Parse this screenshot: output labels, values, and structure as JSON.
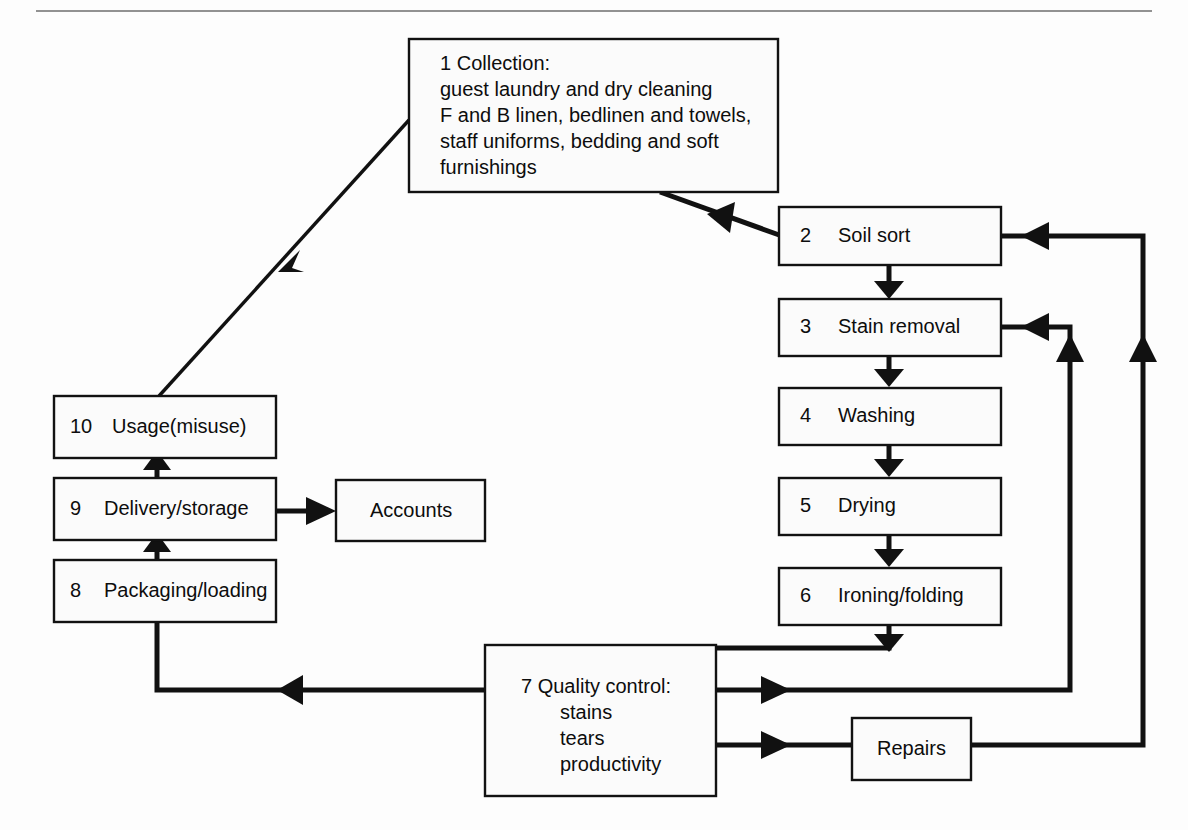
{
  "figure": {
    "top_rule": true,
    "ink_color": "#111111",
    "box_fill": "#fbfbfb"
  },
  "nodes": {
    "collection": {
      "number": "1",
      "title": "Collection:",
      "lines": [
        "guest laundry and dry cleaning",
        "F and B linen, bedlinen and towels,",
        "staff uniforms, bedding and soft",
        "furnishings"
      ]
    },
    "soil_sort": {
      "number": "2",
      "label": "Soil sort"
    },
    "stain_removal": {
      "number": "3",
      "label": "Stain removal"
    },
    "washing": {
      "number": "4",
      "label": "Washing"
    },
    "drying": {
      "number": "5",
      "label": "Drying"
    },
    "ironing_folding": {
      "number": "6",
      "label": "Ironing/folding"
    },
    "quality_control": {
      "number": "7",
      "title": "Quality control:",
      "items": [
        "stains",
        "tears",
        "productivity"
      ]
    },
    "packaging_loading": {
      "number": "8",
      "label": "Packaging/loading"
    },
    "delivery_storage": {
      "number": "9",
      "label": "Delivery/storage"
    },
    "usage_misuse": {
      "number": "10",
      "label": "Usage(misuse)"
    },
    "accounts": {
      "number": "",
      "label": "Accounts"
    },
    "repairs": {
      "number": "",
      "label": "Repairs"
    }
  },
  "connectors": [
    {
      "id": "usage-to-collection",
      "from": "usage_misuse",
      "to": "collection"
    },
    {
      "id": "collection-to-soil-sort",
      "from": "collection",
      "to": "soil_sort"
    },
    {
      "id": "soil-sort-to-stain-removal",
      "from": "soil_sort",
      "to": "stain_removal"
    },
    {
      "id": "stain-removal-to-washing",
      "from": "stain_removal",
      "to": "washing"
    },
    {
      "id": "washing-to-drying",
      "from": "washing",
      "to": "drying"
    },
    {
      "id": "drying-to-ironing",
      "from": "drying",
      "to": "ironing_folding"
    },
    {
      "id": "ironing-to-quality-control",
      "from": "ironing_folding",
      "to": "quality_control"
    },
    {
      "id": "quality-control-to-packaging",
      "from": "quality_control",
      "to": "packaging_loading"
    },
    {
      "id": "packaging-to-delivery",
      "from": "packaging_loading",
      "to": "delivery_storage"
    },
    {
      "id": "delivery-to-usage",
      "from": "delivery_storage",
      "to": "usage_misuse"
    },
    {
      "id": "delivery-to-accounts",
      "from": "delivery_storage",
      "to": "accounts"
    },
    {
      "id": "quality-control-to-stain-removal",
      "from": "quality_control",
      "to": "stain_removal"
    },
    {
      "id": "quality-control-to-repairs",
      "from": "quality_control",
      "to": "repairs"
    },
    {
      "id": "repairs-to-soil-sort",
      "from": "repairs",
      "to": "soil_sort"
    }
  ]
}
